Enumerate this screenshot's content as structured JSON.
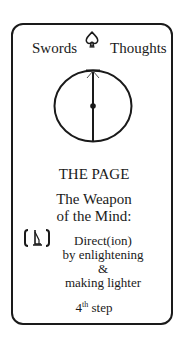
{
  "card": {
    "suit_label": "Swords",
    "suit_icon": "spade-icon",
    "domain_label": "Thoughts",
    "emblem": "circle-with-vertical-sword-icon",
    "title": "THE PAGE",
    "subtitle_line1": "The Weapon",
    "subtitle_line2": "of the Mind:",
    "glyph": "bracketed-sword-glyph-icon",
    "description": [
      "Direct(ion)",
      "by enlightening",
      "&",
      "making lighter"
    ],
    "step_number": "4",
    "step_suffix": "th",
    "step_label": "step"
  }
}
